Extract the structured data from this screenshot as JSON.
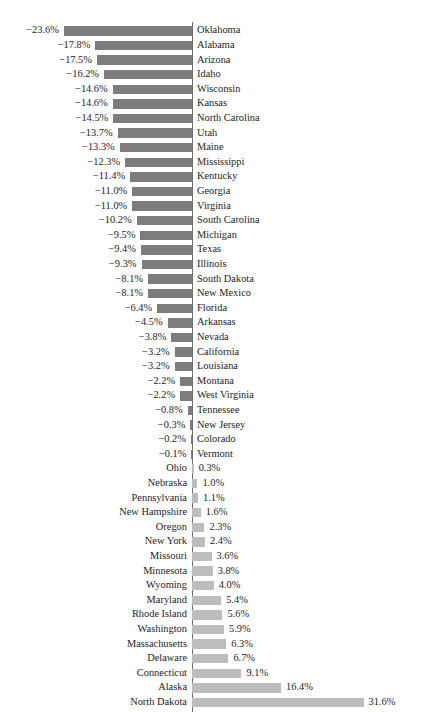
{
  "chart_data": {
    "type": "bar",
    "orientation": "horizontal",
    "title": "",
    "subtitle": "",
    "xlabel": "",
    "ylabel": "",
    "grid": false,
    "legend": null,
    "value_suffix": "%",
    "negative_sign": "−",
    "xlim": [
      -23.6,
      31.6
    ],
    "zero_line": true,
    "colors": {
      "negative_bar": "#7d7d7d",
      "positive_bar": "#bdbdbd",
      "axis_line": "#6e6e6e",
      "text": "#242424",
      "background": "#ffffff"
    },
    "categories": [
      "Oklahoma",
      "Alabama",
      "Arizona",
      "Idaho",
      "Wisconsin",
      "Kansas",
      "North Carolina",
      "Utah",
      "Maine",
      "Mississippi",
      "Kentucky",
      "Georgia",
      "Virginia",
      "South Carolina",
      "Michigan",
      "Texas",
      "Illinois",
      "South Dakota",
      "New Mexico",
      "Florida",
      "Arkansas",
      "Nevada",
      "California",
      "Louisiana",
      "Montana",
      "West Virginia",
      "Tennessee",
      "New Jersey",
      "Colorado",
      "Vermont",
      "Ohio",
      "Nebraska",
      "Pennsylvania",
      "New Hampshire",
      "Oregon",
      "New York",
      "Missouri",
      "Minnesota",
      "Wyoming",
      "Maryland",
      "Rhode Island",
      "Washington",
      "Massachusetts",
      "Delaware",
      "Connecticut",
      "Alaska",
      "North Dakota"
    ],
    "values": [
      -23.6,
      -17.8,
      -17.5,
      -16.2,
      -14.6,
      -14.6,
      -14.5,
      -13.7,
      -13.3,
      -12.3,
      -11.4,
      -11.0,
      -11.0,
      -10.2,
      -9.5,
      -9.4,
      -9.3,
      -8.1,
      -8.1,
      -6.4,
      -4.5,
      -3.8,
      -3.2,
      -3.2,
      -2.2,
      -2.2,
      -0.8,
      -0.3,
      -0.2,
      -0.1,
      0.3,
      1.0,
      1.1,
      1.6,
      2.3,
      2.4,
      3.6,
      3.8,
      4.0,
      5.4,
      5.6,
      5.9,
      6.3,
      6.7,
      9.1,
      16.4,
      31.6
    ],
    "value_labels": [
      "−23.6%",
      "−17.8%",
      "−17.5%",
      "−16.2%",
      "−14.6%",
      "−14.6%",
      "−14.5%",
      "−13.7%",
      "−13.3%",
      "−12.3%",
      "−11.4%",
      "−11.0%",
      "−11.0%",
      "−10.2%",
      "−9.5%",
      "−9.4%",
      "−9.3%",
      "−8.1%",
      "−8.1%",
      "−6.4%",
      "−4.5%",
      "−3.8%",
      "−3.2%",
      "−3.2%",
      "−2.2%",
      "−2.2%",
      "−0.8%",
      "−0.3%",
      "−0.2%",
      "−0.1%",
      "0.3%",
      "1.0%",
      "1.1%",
      "1.6%",
      "2.3%",
      "2.4%",
      "3.6%",
      "3.8%",
      "4.0%",
      "5.4%",
      "5.6%",
      "5.9%",
      "6.3%",
      "6.7%",
      "9.1%",
      "16.4%",
      "31.6%"
    ]
  },
  "layout": {
    "zero_x": 192,
    "px_per_unit": 5.43,
    "row_start_y": 24,
    "row_height": 14.6,
    "bar_height": 9.4,
    "label_gap": 5
  }
}
